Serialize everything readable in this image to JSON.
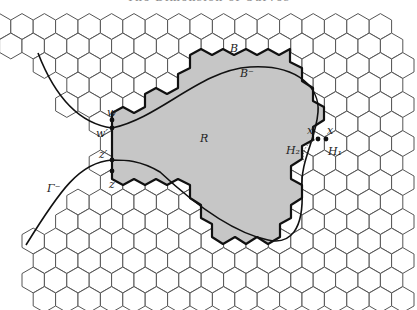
{
  "header": {
    "text": "The Dimension of Curves"
  },
  "lattice": {
    "x0": 22,
    "y0": 26.5,
    "dx": 22.4,
    "dy": 19.5,
    "side": 12.9,
    "rows": 15,
    "cols": 19
  },
  "colors": {
    "region_fill": "#c6c6c6",
    "grid_stroke": "#555555",
    "boundary_stroke": "#111111",
    "curve_stroke": "#111111"
  },
  "labels": {
    "B": "B",
    "B_minus": "B⁻",
    "R": "R",
    "w": "w",
    "w_prime": "w′",
    "z_prime": "z′",
    "z": "z",
    "x": "x",
    "x_prime": "x′",
    "H1": "H₁",
    "H2": "H₂",
    "Gamma_minus": "Γ⁻"
  }
}
